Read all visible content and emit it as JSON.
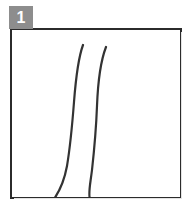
{
  "panel": {
    "badge_label": "1",
    "badge_color": "#8d8d8d",
    "badge_text_color": "#ffffff",
    "frame_border_color": "#2b2b2b",
    "background_color": "#ffffff"
  },
  "drawing": {
    "stroke_color": "#333333",
    "stroke_width": 2.2,
    "curves": [
      {
        "name": "left-curve",
        "path": "M 71 15 C 67 26, 64 46, 62 72 C 60 98, 58 118, 55 136 C 52 152, 47 162, 42 169"
      },
      {
        "name": "right-curve",
        "path": "M 94 17 C 89 30, 86 50, 85 76 C 84 102, 82 122, 80 140 C 78 156, 76 164, 78 169"
      }
    ]
  }
}
